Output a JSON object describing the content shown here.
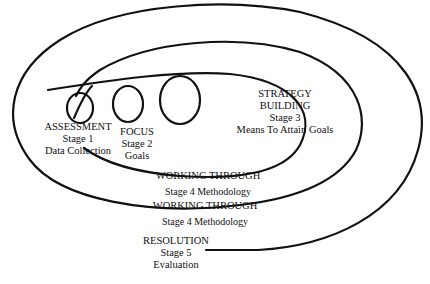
{
  "diagram": {
    "type": "spiral-process",
    "stroke_color": "#111111",
    "background": "#ffffff",
    "stages": [
      {
        "title": "ASSESSMENT",
        "stage": "Stage 1",
        "subtitle": "Data Collection"
      },
      {
        "title": "FOCUS",
        "stage": "Stage 2",
        "subtitle": "Goals"
      },
      {
        "title_line1": "STRATEGY",
        "title_line2": "BUILDING",
        "stage": "Stage 3",
        "subtitle": "Means To Attain Goals"
      },
      {
        "title": "WORKING THROUGH",
        "stage": "Stage 4 Methodology"
      },
      {
        "title": "WORKING THROUGH",
        "stage": "Stage 4 Methodology"
      },
      {
        "title": "RESOLUTION",
        "stage": "Stage 5",
        "subtitle": "Evaluation"
      }
    ]
  }
}
